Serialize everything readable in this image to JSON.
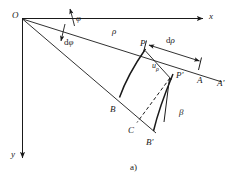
{
  "figure": {
    "caption": "a)",
    "stroke_color": "#1a1a1a",
    "background_color": "#ffffff"
  },
  "axes": {
    "x_label": "x",
    "y_label": "y"
  },
  "points": {
    "origin": "O",
    "p": "P",
    "p_prime": "P'",
    "a": "A",
    "a_prime": "A'",
    "b": "B",
    "b_prime": "B'",
    "c": "C"
  },
  "quantities": {
    "rho": "ρ",
    "d_rho_prefix": "d",
    "d_rho_symbol": "ρ",
    "phi": "φ",
    "d_phi_prefix": "d",
    "d_phi_symbol": "φ",
    "u_rho_base": "u",
    "u_rho_sub": "ρ",
    "beta": "β"
  }
}
